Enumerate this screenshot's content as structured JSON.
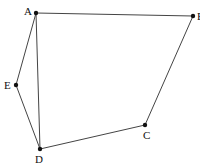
{
  "diagram": {
    "type": "polygon-figure",
    "points": [
      {
        "name": "A",
        "x": 36,
        "y": 13,
        "lx": 24,
        "ly": 15
      },
      {
        "name": "B",
        "x": 193,
        "y": 16,
        "lx": 197,
        "ly": 20
      },
      {
        "name": "C",
        "x": 145,
        "y": 125,
        "lx": 143,
        "ly": 139
      },
      {
        "name": "D",
        "x": 40,
        "y": 149,
        "lx": 35,
        "ly": 163
      },
      {
        "name": "E",
        "x": 16,
        "y": 85,
        "lx": 4,
        "ly": 89
      }
    ],
    "segments": [
      [
        "A",
        "B"
      ],
      [
        "B",
        "C"
      ],
      [
        "C",
        "D"
      ],
      [
        "D",
        "E"
      ],
      [
        "E",
        "A"
      ],
      [
        "A",
        "D"
      ]
    ],
    "caption": "·····"
  }
}
